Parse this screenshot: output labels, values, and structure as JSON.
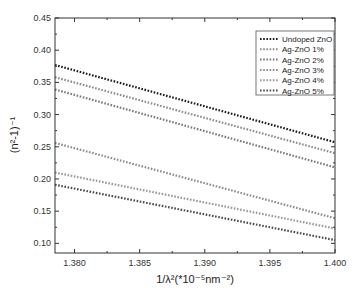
{
  "chart_data": {
    "type": "line",
    "title": "",
    "xlabel": "1/λ²(*10⁻⁵nm⁻²)",
    "ylabel": "(n²-1)⁻¹",
    "xlim": [
      1.3785,
      1.4
    ],
    "ylim": [
      0.085,
      0.45
    ],
    "x_ticks": [
      "1.380",
      "1.385",
      "1.390",
      "1.395",
      "1.400"
    ],
    "y_ticks": [
      "0.10",
      "0.15",
      "0.20",
      "0.25",
      "0.30",
      "0.35",
      "0.40",
      "0.45"
    ],
    "grid": false,
    "legend_position": "upper right",
    "x": [
      1.3785,
      1.4
    ],
    "series": [
      {
        "name": "Undoped ZnO",
        "values": [
          0.377,
          0.257
        ],
        "color": "#1a1a1a"
      },
      {
        "name": "Ag-ZnO 1%",
        "values": [
          0.358,
          0.24
        ],
        "color": "#8c8c8c"
      },
      {
        "name": "Ag-ZnO 2%",
        "values": [
          0.339,
          0.218
        ],
        "color": "#7a7a7a"
      },
      {
        "name": "Ag-ZnO 3%",
        "values": [
          0.256,
          0.139
        ],
        "color": "#8c8c8c"
      },
      {
        "name": "Ag-ZnO 4%",
        "values": [
          0.21,
          0.123
        ],
        "color": "#999999"
      },
      {
        "name": "Ag-ZnO 5%",
        "values": [
          0.191,
          0.105
        ],
        "color": "#4a4a4a"
      }
    ]
  }
}
